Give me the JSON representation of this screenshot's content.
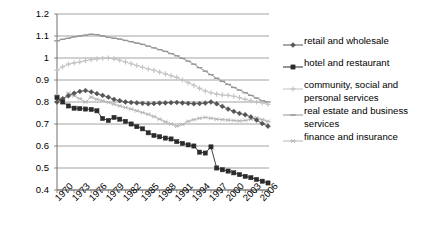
{
  "chart_data": {
    "type": "line",
    "title": "",
    "xlabel": "",
    "ylabel": "",
    "ylim": [
      0.4,
      1.2
    ],
    "ytick_values": [
      "1.2",
      "1.1",
      "1",
      "0.9",
      "0.8",
      "0.7",
      "0.6",
      "0.5",
      "0.4"
    ],
    "grid": true,
    "legend_position": "right",
    "x_all": [
      1970,
      1971,
      1972,
      1973,
      1974,
      1975,
      1976,
      1977,
      1978,
      1979,
      1980,
      1981,
      1982,
      1983,
      1984,
      1985,
      1986,
      1987,
      1988,
      1989,
      1990,
      1991,
      1992,
      1993,
      1994,
      1995,
      1996,
      1997,
      1998,
      1999,
      2000,
      2001,
      2002,
      2003,
      2004,
      2005,
      2006,
      2007
    ],
    "xtick_labels": [
      "1970",
      "1973",
      "1976",
      "1979",
      "1982",
      "1985",
      "1988",
      "1991",
      "1994",
      "1997",
      "2000",
      "2003",
      "2006"
    ],
    "series": [
      {
        "name": "retail and wholesale",
        "marker": "diamond",
        "color": "#555555",
        "values": [
          0.8,
          0.815,
          0.828,
          0.84,
          0.848,
          0.852,
          0.846,
          0.838,
          0.83,
          0.822,
          0.812,
          0.806,
          0.8,
          0.798,
          0.796,
          0.794,
          0.792,
          0.793,
          0.795,
          0.796,
          0.797,
          0.798,
          0.796,
          0.794,
          0.792,
          0.793,
          0.795,
          0.8,
          0.792,
          0.78,
          0.768,
          0.757,
          0.748,
          0.742,
          0.732,
          0.718,
          0.702,
          0.69
        ]
      },
      {
        "name": "hotel and restaurant",
        "marker": "square",
        "color": "#2b2b2b",
        "values": [
          0.82,
          0.8,
          0.782,
          0.772,
          0.77,
          0.768,
          0.766,
          0.76,
          0.725,
          0.716,
          0.73,
          0.722,
          0.712,
          0.7,
          0.688,
          0.678,
          0.66,
          0.648,
          0.642,
          0.636,
          0.632,
          0.62,
          0.612,
          0.605,
          0.6,
          0.572,
          0.568,
          0.596,
          0.5,
          0.492,
          0.486,
          0.478,
          0.47,
          0.462,
          0.456,
          0.448,
          0.44,
          0.432
        ]
      },
      {
        "name": "community, social and personal services",
        "marker": "plus",
        "color": "#c2c2c2",
        "values": [
          0.945,
          0.96,
          0.972,
          0.978,
          0.982,
          0.988,
          0.992,
          0.996,
          0.998,
          1.0,
          0.996,
          0.99,
          0.982,
          0.974,
          0.966,
          0.958,
          0.95,
          0.944,
          0.936,
          0.928,
          0.92,
          0.912,
          0.9,
          0.888,
          0.876,
          0.862,
          0.85,
          0.842,
          0.836,
          0.832,
          0.83,
          0.826,
          0.82,
          0.812,
          0.806,
          0.8,
          0.796,
          0.79
        ]
      },
      {
        "name": "real estate and business services",
        "marker": "dash",
        "color": "#949494",
        "values": [
          1.078,
          1.085,
          1.09,
          1.096,
          1.1,
          1.104,
          1.108,
          1.106,
          1.1,
          1.094,
          1.09,
          1.086,
          1.08,
          1.074,
          1.068,
          1.062,
          1.054,
          1.046,
          1.038,
          1.03,
          1.02,
          1.01,
          0.998,
          0.986,
          0.972,
          0.956,
          0.94,
          0.924,
          0.908,
          0.894,
          0.88,
          0.866,
          0.854,
          0.842,
          0.83,
          0.818,
          0.806,
          0.8
        ]
      },
      {
        "name": "finance and insurance",
        "marker": "star",
        "color": "#b4b4b4",
        "values": [
          0.828,
          0.812,
          0.84,
          0.828,
          0.815,
          0.8,
          0.822,
          0.812,
          0.806,
          0.798,
          0.79,
          0.782,
          0.775,
          0.768,
          0.76,
          0.752,
          0.744,
          0.734,
          0.722,
          0.71,
          0.7,
          0.69,
          0.698,
          0.712,
          0.72,
          0.726,
          0.73,
          0.726,
          0.722,
          0.72,
          0.718,
          0.716,
          0.714,
          0.716,
          0.722,
          0.728,
          0.72,
          0.712
        ]
      }
    ]
  },
  "legend": {
    "items": [
      {
        "label": "retail and wholesale"
      },
      {
        "label": "hotel and restaurant"
      },
      {
        "label": "community, social and"
      },
      {
        "label": "personal services"
      },
      {
        "label": "real estate and business"
      },
      {
        "label": "services"
      },
      {
        "label": "finance and insurance"
      }
    ]
  }
}
